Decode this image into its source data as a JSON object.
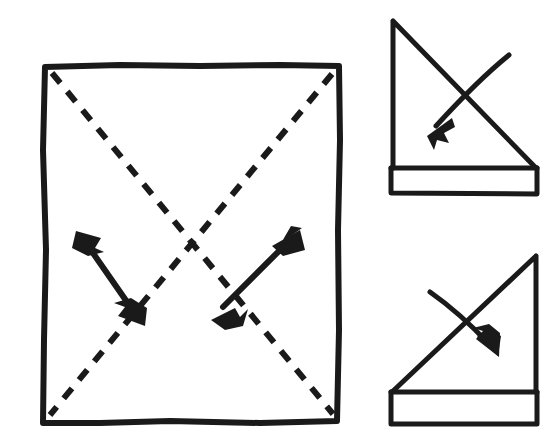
{
  "figure": {
    "title": "Origami fold diagram: square with diagonal valley creases folded into triangle",
    "background_color": "#ffffff",
    "ink_color": "#1a1a1a",
    "style": "hand-drawn line art, no text labels",
    "panel_count": 3
  },
  "panels": [
    {
      "id": "main-square-panel",
      "name": "square-with-diagonals",
      "description": "Large square sheet with two dashed diagonal crease lines crossing at center and two double-headed fold-direction arrows",
      "bounds": {
        "x": 41,
        "y": 64,
        "width": 299,
        "height": 360
      },
      "square": {
        "name": "paper-square-outline",
        "stroke_width": 6,
        "corners": {
          "top_left": [
            45,
            67
          ],
          "top_right": [
            339,
            66
          ],
          "bottom_right": [
            337,
            421
          ],
          "bottom_left": [
            43,
            423
          ]
        }
      },
      "creases": [
        {
          "name": "crease-diagonal-tl-br",
          "style": "dashed",
          "from": [
            52,
            73
          ],
          "to": [
            333,
            414
          ],
          "dash": "13 11",
          "stroke_width": 6
        },
        {
          "name": "crease-diagonal-tr-bl",
          "style": "dashed",
          "from": [
            332,
            74
          ],
          "to": [
            50,
            415
          ],
          "dash": "13 11",
          "stroke_width": 6
        }
      ],
      "arrows": [
        {
          "name": "fold-arrow-left",
          "type": "double-headed",
          "description": "Double-headed arrow perpendicular to the top-right-to-bottom-left crease, indicating fold across it",
          "from": [
            80,
            236
          ],
          "to": [
            140,
            320
          ],
          "stroke_width": 6
        },
        {
          "name": "fold-arrow-right",
          "type": "double-headed",
          "description": "Double-headed arrow perpendicular to the top-left-to-bottom-right crease, indicating fold across it",
          "from": [
            216,
            314
          ],
          "to": [
            297,
            233
          ],
          "stroke_width": 6
        }
      ]
    },
    {
      "id": "top-right-panel",
      "name": "folded-triangle-left-facing",
      "description": "Resulting triangle with vertical edge on the left, hypotenuse descending to the right, and a horizontal band (flap) across the bottom; a curved action arrow crosses the hypotenuse pointing down-left",
      "bounds": {
        "x": 391,
        "y": 19,
        "width": 147,
        "height": 175
      },
      "shape": {
        "name": "triangle-outline",
        "stroke_width": 5,
        "apex": [
          393,
          21
        ],
        "vertical_edge_bottom": [
          393,
          168
        ],
        "hypotenuse_end": [
          536,
          168
        ]
      },
      "band": {
        "name": "bottom-flap-band",
        "stroke_width": 5,
        "x": 391,
        "y": 168,
        "width": 146,
        "height": 26
      },
      "arrow": {
        "name": "turn-over-arrow",
        "type": "single-headed-curved",
        "direction": "down-left",
        "tail": [
          509,
          55
        ],
        "tip": [
          430,
          131
        ],
        "stroke_width": 5
      }
    },
    {
      "id": "bottom-right-panel",
      "name": "folded-triangle-right-facing",
      "description": "Mirrored triangle with vertical edge on the right, hypotenuse rising to the right, and a horizontal band (flap) across the bottom; a curved action arrow crosses the hypotenuse pointing down-right",
      "bounds": {
        "x": 391,
        "y": 254,
        "width": 147,
        "height": 172
      },
      "shape": {
        "name": "triangle-outline",
        "stroke_width": 5,
        "apex": [
          536,
          256
        ],
        "vertical_edge_bottom": [
          536,
          392
        ],
        "hypotenuse_end": [
          392,
          392
        ]
      },
      "band": {
        "name": "bottom-flap-band",
        "stroke_width": 5,
        "x": 391,
        "y": 392,
        "width": 146,
        "height": 32
      },
      "arrow": {
        "name": "turn-over-arrow",
        "type": "single-headed-curved",
        "direction": "down-right",
        "tail": [
          430,
          292
        ],
        "tip": [
          497,
          352
        ],
        "stroke_width": 5
      }
    }
  ]
}
